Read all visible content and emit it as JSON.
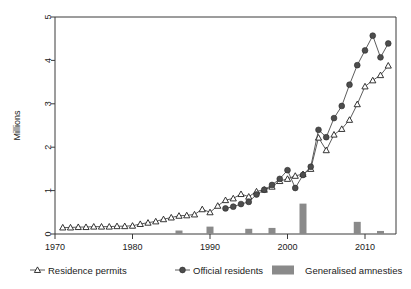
{
  "chart_data": {
    "type": "line",
    "title": "",
    "xlabel": "",
    "ylabel": "Millions",
    "xlim": [
      1970,
      2014
    ],
    "ylim": [
      0,
      5
    ],
    "xticks": [
      1970,
      1980,
      1990,
      2000,
      2010
    ],
    "yticks": [
      0,
      1,
      2,
      3,
      4,
      5
    ],
    "grid": false,
    "legend_position": "bottom",
    "series": [
      {
        "name": "Residence permits",
        "marker": "open-triangle",
        "x": [
          1971,
          1972,
          1973,
          1974,
          1975,
          1976,
          1977,
          1978,
          1979,
          1980,
          1981,
          1982,
          1983,
          1984,
          1985,
          1986,
          1987,
          1988,
          1989,
          1990,
          1991,
          1992,
          1993,
          1994,
          1995,
          1996,
          1997,
          1998,
          1999,
          2000,
          2001,
          2002,
          2003,
          2004,
          2005,
          2006,
          2007,
          2008,
          2009,
          2010,
          2011,
          2012,
          2013
        ],
        "values": [
          0.15,
          0.15,
          0.16,
          0.16,
          0.17,
          0.17,
          0.17,
          0.18,
          0.18,
          0.19,
          0.23,
          0.26,
          0.29,
          0.34,
          0.38,
          0.42,
          0.43,
          0.45,
          0.57,
          0.5,
          0.65,
          0.78,
          0.82,
          0.92,
          0.86,
          0.98,
          1.02,
          1.09,
          1.22,
          1.27,
          1.34,
          1.38,
          1.5,
          2.22,
          1.93,
          2.29,
          2.42,
          2.63,
          2.99,
          3.4,
          3.54,
          3.66,
          3.88
        ]
      },
      {
        "name": "Official residents",
        "marker": "filled-circle",
        "x": [
          1992,
          1993,
          1994,
          1995,
          1996,
          1997,
          1998,
          1999,
          2000,
          2001,
          2002,
          2003,
          2004,
          2005,
          2006,
          2007,
          2008,
          2009,
          2010,
          2011,
          2012,
          2013
        ],
        "values": [
          0.59,
          0.63,
          0.69,
          0.74,
          0.91,
          1.02,
          1.13,
          1.27,
          1.47,
          1.06,
          1.36,
          1.55,
          2.4,
          2.23,
          2.67,
          2.95,
          3.44,
          3.89,
          4.23,
          4.57,
          4.07,
          4.39
        ]
      }
    ],
    "bars": {
      "name": "Generalised amnesties",
      "x": [
        1986,
        1990,
        1995,
        1998,
        2002,
        2009,
        2012
      ],
      "values": [
        0.08,
        0.17,
        0.12,
        0.14,
        0.7,
        0.28,
        0.07
      ]
    }
  },
  "legend": {
    "items": [
      {
        "label": "Residence permits",
        "marker": "open-triangle"
      },
      {
        "label": "Official residents",
        "marker": "filled-circle"
      },
      {
        "label": "Generalised amnesties",
        "marker": "gray-bar"
      }
    ]
  },
  "colors": {
    "line": "#4a4a4a",
    "dot_fill": "#4d4d4d",
    "bar": "#8a8a8a",
    "axis": "#3a3a3a",
    "background": "#ffffff"
  }
}
